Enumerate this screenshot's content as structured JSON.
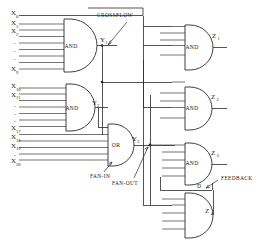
{
  "diagram": {
    "colors": {
      "line": "#2b2b2b",
      "background": "#ffffff",
      "text": "#1a1a1a"
    },
    "input_groups": [
      {
        "name": "group-top",
        "labels": [
          "X",
          "X",
          "X",
          "X"
        ],
        "subs": [
          "0",
          "1",
          "2",
          "9"
        ],
        "ellipsis": [
          ".",
          ".",
          ".",
          "."
        ],
        "count_lines": 9
      },
      {
        "name": "group-middle",
        "labels": [
          "X",
          "X",
          "X"
        ],
        "subs": [
          "10",
          "11",
          "17"
        ],
        "ellipsis": [
          ".",
          ".",
          "."
        ],
        "count_lines": 7
      },
      {
        "name": "group-bottom",
        "labels": [
          "X",
          "X",
          "X"
        ],
        "subs": [
          "18",
          "19",
          "20"
        ],
        "ellipsis": [
          "."
        ],
        "count_lines": 4
      }
    ],
    "inputs": [
      {
        "base": "X",
        "sub": "0"
      },
      {
        "base": "X",
        "sub": "1"
      },
      {
        "base": "X",
        "sub": "2"
      },
      {
        "base": "X",
        "sub": "9"
      },
      {
        "base": "X",
        "sub": "10"
      },
      {
        "base": "X",
        "sub": "11"
      },
      {
        "base": "X",
        "sub": "17"
      },
      {
        "base": "X",
        "sub": "18"
      },
      {
        "base": "X",
        "sub": "19"
      },
      {
        "base": "X",
        "sub": "20"
      }
    ],
    "gates": [
      {
        "id": "and-1",
        "type": "AND",
        "label": "AND",
        "out_base": "Y",
        "out_sub": "1"
      },
      {
        "id": "and-2",
        "type": "AND",
        "label": "AND",
        "out_base": "Y",
        "out_sub": "2"
      },
      {
        "id": "or-1",
        "type": "OR",
        "label": "OR",
        "out_base": "Y",
        "out_sub": "3"
      },
      {
        "id": "and-z1",
        "type": "AND",
        "label": "AND",
        "out_base": "Z",
        "out_sub": "1"
      },
      {
        "id": "and-z2",
        "type": "AND",
        "label": "AND",
        "out_base": "Z",
        "out_sub": "2"
      },
      {
        "id": "and-z3",
        "type": "AND",
        "label": "AND",
        "out_base": "Z",
        "out_sub": "3"
      },
      {
        "id": "and-z4",
        "type": "AND",
        "label": "AND",
        "out_base": "Z",
        "out_sub": "4"
      }
    ],
    "annotations": [
      {
        "id": "crossflow",
        "text": "CROSSFLOW"
      },
      {
        "id": "fan-in",
        "text": "FAN-IN"
      },
      {
        "id": "fan-out",
        "text": "FAN-OUT"
      },
      {
        "id": "feedback",
        "text": "FEEDBACK"
      },
      {
        "id": "feedback-node",
        "text": "D"
      }
    ],
    "signals": {
      "y1": {
        "base": "Y",
        "sub": "1"
      },
      "y2": {
        "base": "Y",
        "sub": "2"
      },
      "y3": {
        "base": "Y",
        "sub": "3"
      },
      "z1": {
        "base": "Z",
        "sub": "1"
      },
      "z2": {
        "base": "Z",
        "sub": "2"
      },
      "z3": {
        "base": "Z",
        "sub": "3"
      },
      "z4": {
        "base": "Z",
        "sub": "4"
      },
      "d": {
        "base": "D",
        "sub": ""
      }
    }
  }
}
